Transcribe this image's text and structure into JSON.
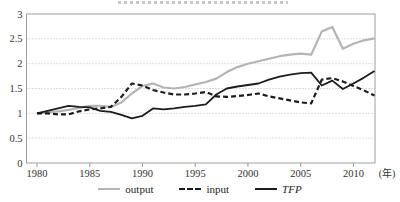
{
  "figure": {
    "x_unit_label": "(年)",
    "colors": {
      "output_line": "#b4b4b4",
      "black_line": "#1c1c1c",
      "grid": "#bfbfbf",
      "frame": "#9e9e9e",
      "tick_text": "#333333"
    }
  },
  "legend": {
    "items": [
      {
        "label": "output",
        "style": "solid",
        "color": "#b4b4b4",
        "italic": false
      },
      {
        "label": "input",
        "style": "dashed",
        "color": "#1c1c1c",
        "italic": false
      },
      {
        "label": "TFP",
        "style": "solid",
        "color": "#1c1c1c",
        "italic": true
      }
    ]
  },
  "chart_data": {
    "type": "line",
    "title": "",
    "xlabel": "(年)",
    "ylabel": "",
    "xlim": [
      1980,
      2012
    ],
    "ylim": [
      0,
      3
    ],
    "xticks": [
      1980,
      1985,
      1990,
      1995,
      2000,
      2005,
      2010
    ],
    "yticks": [
      0,
      0.5,
      1,
      1.5,
      2,
      2.5,
      3
    ],
    "grid": "horizontal-dotted",
    "legend_position": "bottom",
    "x": [
      1980,
      1981,
      1982,
      1983,
      1984,
      1985,
      1986,
      1987,
      1988,
      1989,
      1990,
      1991,
      1992,
      1993,
      1994,
      1995,
      1996,
      1997,
      1998,
      1999,
      2000,
      2001,
      2002,
      2003,
      2004,
      2005,
      2006,
      2007,
      2008,
      2009,
      2010,
      2011,
      2012
    ],
    "series": [
      {
        "name": "output",
        "color": "#b4b4b4",
        "dash": null,
        "width": 2.2,
        "values": [
          1.0,
          1.02,
          1.04,
          1.07,
          1.11,
          1.15,
          1.15,
          1.13,
          1.22,
          1.4,
          1.55,
          1.6,
          1.52,
          1.5,
          1.53,
          1.58,
          1.63,
          1.7,
          1.83,
          1.93,
          2.0,
          2.05,
          2.1,
          2.15,
          2.18,
          2.2,
          2.18,
          2.65,
          2.74,
          2.3,
          2.4,
          2.47,
          2.51
        ]
      },
      {
        "name": "input",
        "color": "#1c1c1c",
        "dash": "5 3",
        "width": 2.2,
        "values": [
          1.0,
          1.0,
          0.98,
          0.98,
          1.04,
          1.08,
          1.1,
          1.13,
          1.33,
          1.6,
          1.56,
          1.47,
          1.42,
          1.38,
          1.38,
          1.4,
          1.43,
          1.34,
          1.33,
          1.35,
          1.37,
          1.4,
          1.34,
          1.3,
          1.26,
          1.22,
          1.2,
          1.68,
          1.71,
          1.64,
          1.55,
          1.46,
          1.36
        ]
      },
      {
        "name": "TFP",
        "color": "#1c1c1c",
        "dash": null,
        "width": 1.8,
        "values": [
          1.0,
          1.05,
          1.1,
          1.15,
          1.13,
          1.12,
          1.05,
          1.03,
          0.97,
          0.9,
          0.95,
          1.1,
          1.08,
          1.1,
          1.13,
          1.15,
          1.18,
          1.38,
          1.5,
          1.54,
          1.57,
          1.6,
          1.68,
          1.74,
          1.78,
          1.81,
          1.82,
          1.56,
          1.66,
          1.49,
          1.6,
          1.72,
          1.85
        ]
      }
    ]
  }
}
